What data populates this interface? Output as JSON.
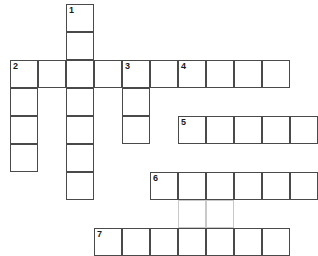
{
  "puzzle": {
    "title": "Crossword Puzzle Grid",
    "type": "crossword",
    "grid": {
      "cell_size": 28,
      "origin_x": 10,
      "origin_y": 4,
      "columns": 9,
      "rows": 8,
      "border_color": "#4a4a4a",
      "guide_color": "#c9c9c9",
      "cell_fill": "#ffffff",
      "background": "#ffffff"
    },
    "entries": [
      {
        "number": "1",
        "direction": "down",
        "row": 0,
        "col": 2,
        "length": 6
      },
      {
        "number": "2",
        "direction": "across",
        "row": 2,
        "col": 0,
        "length": 9
      },
      {
        "number": "2",
        "direction": "down",
        "row": 2,
        "col": 0,
        "length": 4
      },
      {
        "number": "3",
        "direction": "down",
        "row": 2,
        "col": 4,
        "length": 3
      },
      {
        "number": "4",
        "direction": "down",
        "row": 2,
        "col": 6,
        "length": 6
      },
      {
        "number": "5",
        "direction": "across",
        "row": 4,
        "col": 6,
        "length": 5
      },
      {
        "number": "6",
        "direction": "across",
        "row": 6,
        "col": 5,
        "length": 6
      },
      {
        "number": "7",
        "direction": "across",
        "row": 8,
        "col": 3,
        "length": 7
      }
    ],
    "cells": [
      {
        "row": 0,
        "col": 2,
        "number": "1"
      },
      {
        "row": 1,
        "col": 2,
        "number": ""
      },
      {
        "row": 2,
        "col": 0,
        "number": "2"
      },
      {
        "row": 2,
        "col": 1,
        "number": ""
      },
      {
        "row": 2,
        "col": 2,
        "number": ""
      },
      {
        "row": 2,
        "col": 3,
        "number": ""
      },
      {
        "row": 2,
        "col": 4,
        "number": "3"
      },
      {
        "row": 2,
        "col": 5,
        "number": ""
      },
      {
        "row": 2,
        "col": 6,
        "number": "4"
      },
      {
        "row": 2,
        "col": 7,
        "number": ""
      },
      {
        "row": 2,
        "col": 8,
        "number": ""
      },
      {
        "row": 2,
        "col": 9,
        "number": ""
      },
      {
        "row": 3,
        "col": 0,
        "number": ""
      },
      {
        "row": 3,
        "col": 2,
        "number": ""
      },
      {
        "row": 3,
        "col": 4,
        "number": ""
      },
      {
        "row": 4,
        "col": 0,
        "number": ""
      },
      {
        "row": 4,
        "col": 2,
        "number": ""
      },
      {
        "row": 4,
        "col": 4,
        "number": ""
      },
      {
        "row": 4,
        "col": 6,
        "number": "5"
      },
      {
        "row": 4,
        "col": 7,
        "number": ""
      },
      {
        "row": 4,
        "col": 8,
        "number": ""
      },
      {
        "row": 4,
        "col": 9,
        "number": ""
      },
      {
        "row": 4,
        "col": 10,
        "number": ""
      },
      {
        "row": 5,
        "col": 0,
        "number": ""
      },
      {
        "row": 5,
        "col": 2,
        "number": ""
      },
      {
        "row": 6,
        "col": 2,
        "number": ""
      },
      {
        "row": 6,
        "col": 5,
        "number": "6"
      },
      {
        "row": 6,
        "col": 6,
        "number": ""
      },
      {
        "row": 6,
        "col": 7,
        "number": ""
      },
      {
        "row": 6,
        "col": 8,
        "number": ""
      },
      {
        "row": 6,
        "col": 9,
        "number": ""
      },
      {
        "row": 6,
        "col": 10,
        "number": ""
      },
      {
        "row": 8,
        "col": 3,
        "number": "7"
      },
      {
        "row": 8,
        "col": 4,
        "number": ""
      },
      {
        "row": 8,
        "col": 5,
        "number": ""
      },
      {
        "row": 8,
        "col": 6,
        "number": ""
      },
      {
        "row": 8,
        "col": 7,
        "number": ""
      },
      {
        "row": 8,
        "col": 8,
        "number": ""
      },
      {
        "row": 8,
        "col": 9,
        "number": ""
      }
    ],
    "guide_cells": [
      {
        "row": 7,
        "col": 6
      },
      {
        "row": 7,
        "col": 7
      }
    ]
  }
}
